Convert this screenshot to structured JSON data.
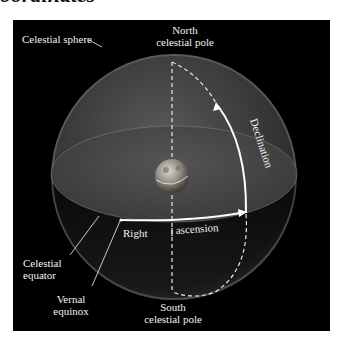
{
  "page": {
    "heading_fragment": "oordinates"
  },
  "figure": {
    "background": "#000000",
    "labels": {
      "north_pole": [
        "North",
        "celestial pole"
      ],
      "celestial_sphere": "Celestial sphere",
      "declination": "Declination",
      "right": "Right",
      "ascension": "ascension",
      "celestial_equator": [
        "Celestial",
        "equator"
      ],
      "vernal_equinox": [
        "Vernal",
        "equinox"
      ],
      "south_pole": [
        "South",
        "celestial pole"
      ]
    },
    "elements": {
      "sphere": "celestial-sphere",
      "earth": "earth-globe",
      "axis": "polar-axis-dashed",
      "equator": "celestial-equator-ellipse",
      "ra_arc": "right-ascension-arrow",
      "dec_arc": "declination-arrow"
    },
    "colors": {
      "arrow": "#ffffff",
      "text": "#f2f2f2",
      "sphere_fill": "#3a3a3a"
    }
  }
}
